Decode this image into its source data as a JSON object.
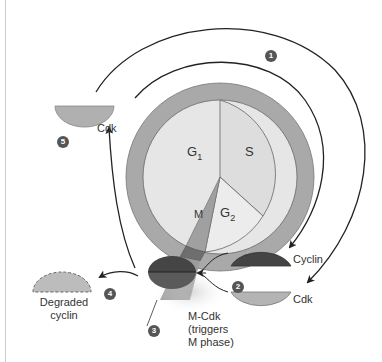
{
  "figure": {
    "type": "cell-cycle-diagram",
    "colors": {
      "ring": "#a9a9a9",
      "inner_circle": "#e6e6e6",
      "s_sector": "#dedede",
      "m_wedge": "#9a9a9a",
      "cyclin": "#444444",
      "cdk": "#b4b4b4",
      "degraded": "#bcbcbc",
      "step_marker": "#555555"
    },
    "phases": {
      "g1": "G",
      "g1_sub": "1",
      "s": "S",
      "g2": "G",
      "g2_sub": "2",
      "m": "M"
    },
    "labels": {
      "cdk_top": "Cdk",
      "cyclin": "Cyclin",
      "cdk_bottom": "Cdk",
      "mcdk_line1": "M-Cdk",
      "mcdk_line2": "(triggers",
      "mcdk_line3": "M phase)",
      "degraded_line1": "Degraded",
      "degraded_line2": "cyclin"
    },
    "steps": [
      "1",
      "2",
      "3",
      "4",
      "5"
    ]
  }
}
